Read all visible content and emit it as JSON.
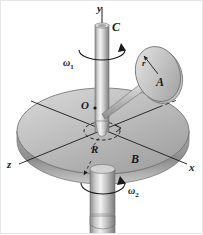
{
  "figure": {
    "background_color": "#ffffff",
    "ink_color": "#1a1a1a"
  },
  "axes": {
    "y_label": "y",
    "x_label": "x",
    "z_label": "z"
  },
  "bodies": {
    "shaft_label": "C",
    "disk_label": "A",
    "turntable_label": "B",
    "origin_label": "O"
  },
  "dimensions": {
    "disk_radius_label": "r",
    "turntable_radius_label": "R"
  },
  "angular_velocities": {
    "omega1_symbol": "ω",
    "omega1_subscript": "1",
    "omega2_symbol": "ω",
    "omega2_subscript": "2"
  },
  "colors": {
    "metal_light": "#f0f0f0",
    "metal_mid": "#b9b9b9",
    "metal_dark": "#8a8a8a",
    "disk_top": "#c2c2c2",
    "disk_edge": "#9a9a9a",
    "line": "#1a1a1a"
  }
}
